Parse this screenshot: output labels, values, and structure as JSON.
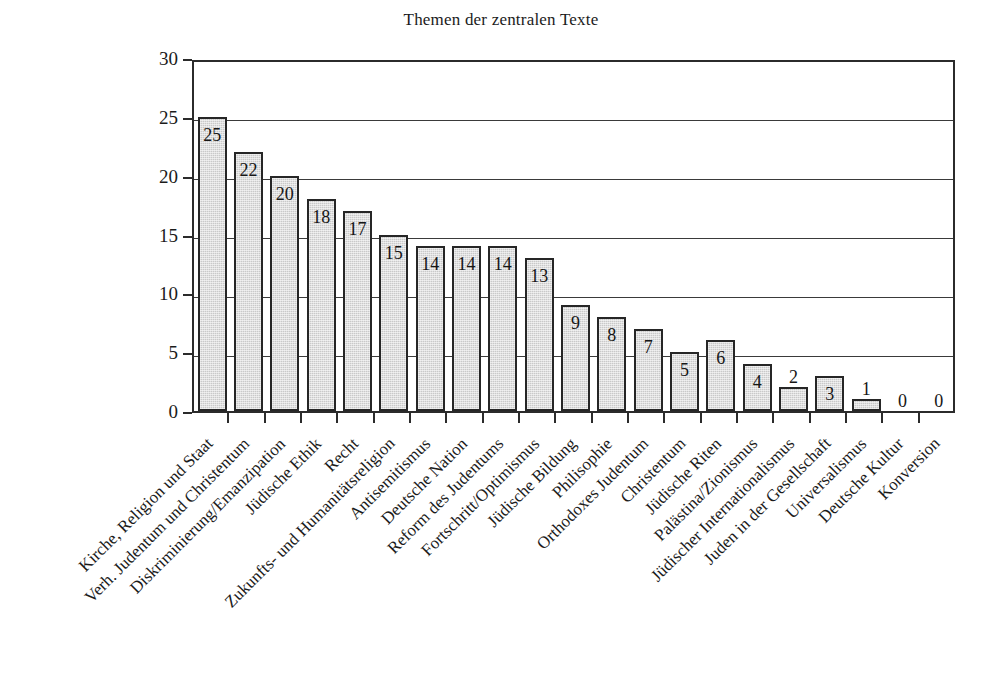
{
  "chart_data": {
    "type": "bar",
    "title": "Themen der zentralen Texte",
    "xlabel": "",
    "ylabel": "",
    "ylim": [
      0,
      30
    ],
    "yticks": [
      0,
      5,
      10,
      15,
      20,
      25,
      30
    ],
    "grid": "horizontal",
    "legend": "none",
    "categories": [
      "Kirche, Religion und Staat",
      "Verh. Judentum und Christentum",
      "Diskriminierung/Emanzipation",
      "Jüdische Ethik",
      "Recht",
      "Zukunfts- und Humanitätsreligion",
      "Antisemitismus",
      "Deutsche Nation",
      "Reform des Judentums",
      "Fortschritt/Optimismus",
      "Jüdische Bildung",
      "Philisophie",
      "Orthodoxes Judentum",
      "Christentum",
      "Jüdische Riten",
      "Palästina/Zionismus",
      "Jüdischer Internationalismus",
      "Juden in der Gesellschaft",
      "Universalismus",
      "Deutsche Kultur",
      "Konversion"
    ],
    "values": [
      25,
      22,
      20,
      18,
      17,
      15,
      14,
      14,
      14,
      13,
      9,
      8,
      7,
      5,
      6,
      4,
      2,
      3,
      1,
      0,
      0
    ]
  },
  "style": {
    "bar_fill": "#c9c9c9",
    "bar_border": "#262626",
    "axis_color": "#2b2b2b",
    "grid_color": "#3a3a3a",
    "text_color": "#1b1b1b",
    "background": "#ffffff"
  }
}
